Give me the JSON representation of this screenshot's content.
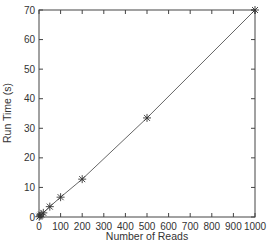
{
  "chart_data": {
    "type": "line",
    "title": "",
    "xlabel": "Number of Reads",
    "ylabel": "Run Time (s)",
    "xlim": [
      0,
      1000
    ],
    "ylim": [
      0,
      70
    ],
    "xticks": [
      0,
      100,
      200,
      300,
      400,
      500,
      600,
      700,
      800,
      900,
      1000
    ],
    "yticks": [
      0,
      10,
      20,
      30,
      40,
      50,
      60,
      70
    ],
    "grid": false,
    "legend": null,
    "marker": "x-plus",
    "series": [
      {
        "name": "Run Time",
        "x": [
          1,
          5,
          10,
          20,
          50,
          100,
          200,
          500,
          1000
        ],
        "y": [
          0.1,
          0.4,
          0.8,
          1.4,
          3.5,
          6.7,
          12.8,
          33.5,
          70
        ]
      }
    ],
    "colors": {
      "line": "#555555",
      "axis": "#444444",
      "marker": "#333333"
    }
  }
}
